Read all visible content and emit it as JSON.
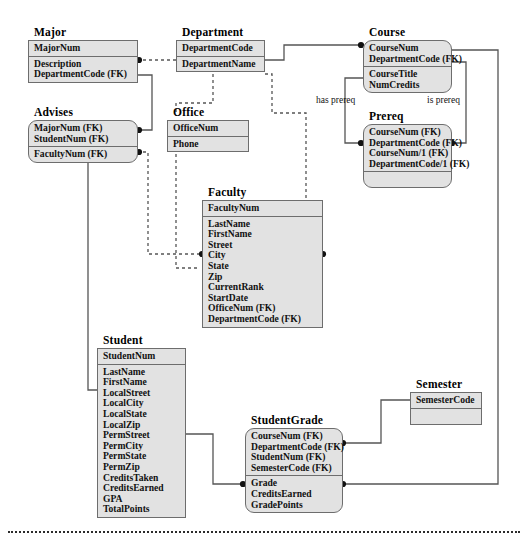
{
  "diagram": {
    "type": "entity-relationship-diagram",
    "notation": "crows-foot-less / filled-circle connector",
    "entities": [
      {
        "id": "major",
        "title": "Major",
        "shape": "rectangle",
        "key_attributes": [
          "MajorNum"
        ],
        "attributes": [
          "Description",
          "DepartmentCode (FK)"
        ]
      },
      {
        "id": "department",
        "title": "Department",
        "shape": "rectangle",
        "key_attributes": [
          "DepartmentCode"
        ],
        "attributes": [
          "DepartmentName"
        ]
      },
      {
        "id": "course",
        "title": "Course",
        "shape": "rounded",
        "key_attributes": [
          "CourseNum",
          "DepartmentCode (FK)"
        ],
        "attributes": [
          "CourseTitle",
          "NumCredits"
        ]
      },
      {
        "id": "advises",
        "title": "Advises",
        "shape": "rounded",
        "key_attributes": [
          "MajorNum (FK)",
          "StudentNum (FK)"
        ],
        "attributes": [
          "FacultyNum (FK)"
        ]
      },
      {
        "id": "office",
        "title": "Office",
        "shape": "rectangle",
        "key_attributes": [
          "OfficeNum"
        ],
        "attributes": [
          "Phone"
        ]
      },
      {
        "id": "prereq",
        "title": "Prereq",
        "shape": "rounded",
        "key_attributes": [
          "CourseNum (FK)",
          "DepartmentCode (FK)",
          "CourseNum/1 (FK)",
          "DepartmentCode/1 (FK)"
        ],
        "attributes": []
      },
      {
        "id": "faculty",
        "title": "Faculty",
        "shape": "rectangle",
        "key_attributes": [
          "FacultyNum"
        ],
        "attributes": [
          "LastName",
          "FirstName",
          "Street",
          "City",
          "State",
          "Zip",
          "CurrentRank",
          "StartDate",
          "OfficeNum (FK)",
          "DepartmentCode (FK)"
        ]
      },
      {
        "id": "student",
        "title": "Student",
        "shape": "rectangle",
        "key_attributes": [
          "StudentNum"
        ],
        "attributes": [
          "LastName",
          "FirstName",
          "LocalStreet",
          "LocalCity",
          "LocalState",
          "LocalZip",
          "PermStreet",
          "PermCity",
          "PermState",
          "PermZip",
          "CreditsTaken",
          "CreditsEarned",
          "GPA",
          "TotalPoints"
        ]
      },
      {
        "id": "semester",
        "title": "Semester",
        "shape": "rectangle",
        "key_attributes": [
          "SemesterCode"
        ],
        "attributes": []
      },
      {
        "id": "studentgrade",
        "title": "StudentGrade",
        "shape": "rounded",
        "key_attributes": [
          "CourseNum (FK)",
          "DepartmentCode (FK)",
          "StudentNum (FK)",
          "SemesterCode (FK)"
        ],
        "attributes": [
          "Grade",
          "CreditsEarned",
          "GradePoints"
        ]
      }
    ],
    "relationship_labels": [
      {
        "id": "has-prereq",
        "text": "has  prereq"
      },
      {
        "id": "is-prereq",
        "text": "is  prereq"
      }
    ],
    "colors": {
      "box_fill": "#e2e2e2",
      "box_border": "#6d6d6d",
      "connector": "#555555",
      "connector_dot": "#111111",
      "text": "#111111",
      "page_rule": "#2b2b2b"
    }
  }
}
